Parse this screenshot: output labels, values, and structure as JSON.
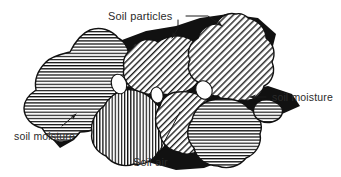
{
  "figure": {
    "background_color": "#ffffff",
    "ink_color": "#111111",
    "text_color": "#2b2b2b",
    "width": 341,
    "height": 177
  },
  "labels": {
    "soil_particles": "Soil particles",
    "soil_moisture_right": "soil moisture",
    "soil_moisture_left": "soil moisture",
    "soil_air": "Soil air"
  },
  "legend_semantics": {
    "hatched_regions": "Soil particles",
    "black_regions": "soil moisture",
    "white_ellipses": "Soil air"
  },
  "particles": [
    {
      "name": "particle-left-large",
      "hatch": "horizontal",
      "fill_color": "#ffffff",
      "stroke_color": "#111111"
    },
    {
      "name": "particle-center-top",
      "hatch": "diagonal-down",
      "fill_color": "#ffffff",
      "stroke_color": "#111111"
    },
    {
      "name": "particle-right-top",
      "hatch": "diagonal-down",
      "fill_color": "#ffffff",
      "stroke_color": "#111111"
    },
    {
      "name": "particle-bottom-left",
      "hatch": "vertical",
      "fill_color": "#ffffff",
      "stroke_color": "#111111"
    },
    {
      "name": "particle-bottom-center",
      "hatch": "diagonal-down",
      "fill_color": "#ffffff",
      "stroke_color": "#111111"
    },
    {
      "name": "particle-bottom-right",
      "hatch": "horizontal",
      "fill_color": "#ffffff",
      "stroke_color": "#111111"
    },
    {
      "name": "particle-right-small",
      "hatch": "horizontal",
      "fill_color": "#ffffff",
      "stroke_color": "#111111"
    }
  ],
  "air_pockets": [
    {
      "name": "air-pocket-left"
    },
    {
      "name": "air-pocket-center"
    },
    {
      "name": "air-pocket-right"
    }
  ]
}
